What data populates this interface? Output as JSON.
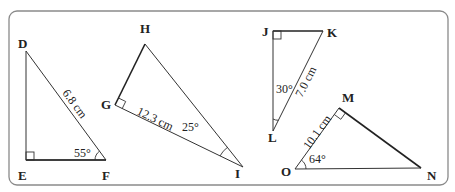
{
  "diagram": {
    "frame": {
      "stroke": "#888888",
      "radius": 8
    },
    "triangles": [
      {
        "name": "DEF",
        "vertices": {
          "D": "D",
          "E": "E",
          "F": "F"
        },
        "right_angle_at": "E",
        "hypotenuse_label": "6.8 cm",
        "angle_label": "55°",
        "angle_at": "F"
      },
      {
        "name": "GHI",
        "vertices": {
          "G": "G",
          "H": "H",
          "I": "I"
        },
        "right_angle_at": "G",
        "side_label": "12.3 cm",
        "side": "GI",
        "angle_label": "25°",
        "angle_at": "I"
      },
      {
        "name": "JKL",
        "vertices": {
          "J": "J",
          "K": "K",
          "L": "L"
        },
        "right_angle_at": "J",
        "hypotenuse_label": "7.0 cm",
        "angle_label": "30°",
        "angle_at": "L"
      },
      {
        "name": "MNO",
        "vertices": {
          "M": "M",
          "N": "N",
          "O": "O"
        },
        "right_angle_at": "M",
        "side_label": "10.1 cm",
        "side": "OM",
        "angle_label": "64°",
        "angle_at": "O"
      }
    ]
  }
}
